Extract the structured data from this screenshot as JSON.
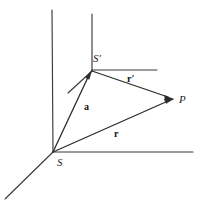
{
  "figure": {
    "type": "vector-diagram",
    "width": 199,
    "height": 209,
    "background_color": "#ffffff",
    "line_color": "#2b2b2b",
    "axis_color": "#3a3a3a"
  },
  "points": {
    "S": {
      "label": "S",
      "x": 53,
      "y": 152,
      "label_x": 57,
      "label_y": 166
    },
    "S_prime": {
      "label": "S′",
      "x": 92,
      "y": 71,
      "label_x": 93,
      "label_y": 62
    },
    "P": {
      "label": "P",
      "x": 173,
      "y": 99,
      "label_x": 179,
      "label_y": 103
    }
  },
  "vectors": [
    {
      "name": "a",
      "label": "a",
      "from": "S",
      "to": "S_prime",
      "x1": 53,
      "y1": 152,
      "x2": 92,
      "y2": 71,
      "label_x": 84,
      "label_y": 110
    },
    {
      "name": "r",
      "label": "r",
      "from": "S",
      "to": "P",
      "x1": 53,
      "y1": 152,
      "x2": 173,
      "y2": 99,
      "label_x": 114,
      "label_y": 137
    },
    {
      "name": "r_prime",
      "label": "r",
      "prime": "′",
      "from": "S_prime",
      "to": "P",
      "x1": 92,
      "y1": 71,
      "x2": 173,
      "y2": 99,
      "label_x": 127,
      "label_y": 82
    }
  ],
  "axes": {
    "primary_origin": "S",
    "lines": [
      {
        "name": "vertical-axis-S",
        "x1": 52,
        "y1": 10,
        "x2": 53,
        "y2": 152
      },
      {
        "name": "horizontal-axis-S",
        "x1": 53,
        "y1": 152,
        "x2": 193,
        "y2": 152
      },
      {
        "name": "depth-axis-S",
        "x1": 53,
        "y1": 152,
        "x2": 5,
        "y2": 199
      },
      {
        "name": "vertical-axis-S-prime",
        "x1": 92,
        "y1": 14,
        "x2": 92,
        "y2": 71
      },
      {
        "name": "horizontal-axis-S-prime",
        "x1": 92,
        "y1": 70,
        "x2": 157,
        "y2": 70
      },
      {
        "name": "depth-axis-S-prime",
        "x1": 92,
        "y1": 71,
        "x2": 68,
        "y2": 93
      }
    ]
  }
}
